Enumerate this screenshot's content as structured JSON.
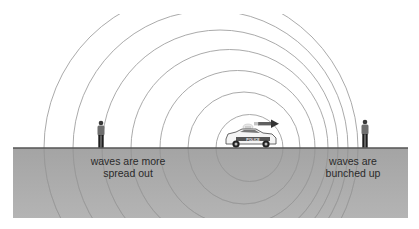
{
  "diagram": {
    "labels": {
      "left": "waves are more spread out",
      "left_line1": "waves are more",
      "left_line2": "spread out",
      "right_line1": "waves are",
      "right_line2": "bunched up"
    },
    "car": {
      "text": "POLICE",
      "direction": "right"
    },
    "colors": {
      "sky": "#ffffff",
      "ground": "#a9a9a9",
      "ground_line": "#5a5a5a",
      "wave": "#9a9a9a",
      "text": "#2a2a2a",
      "arrow": "#333333"
    },
    "waves": [
      {
        "cx": 249.5,
        "r": 33.5
      },
      {
        "cx": 244,
        "r": 56
      },
      {
        "cx": 237.5,
        "r": 77.5
      },
      {
        "cx": 229.5,
        "r": 98.5
      },
      {
        "cx": 220,
        "r": 118
      },
      {
        "cx": 210.5,
        "r": 137.5
      },
      {
        "cx": 201,
        "r": 157
      }
    ]
  }
}
